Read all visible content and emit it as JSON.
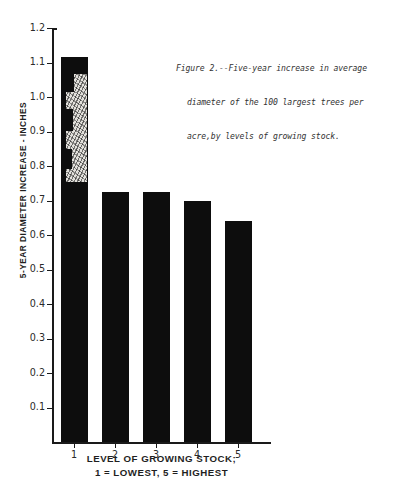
{
  "chart_data": {
    "type": "bar",
    "title": "",
    "caption_lines": [
      "Figure 2.--Five-year increase in average",
      "diameter of the 100 largest trees per",
      "acre,by levels of growing stock."
    ],
    "caption": "Figure 2.--Five-year increase in average diameter of the 100 largest trees per acre,by levels of growing stock.",
    "categories": [
      "1",
      "2",
      "3",
      "4",
      "5"
    ],
    "values": [
      1.115,
      0.725,
      0.725,
      0.7,
      0.64
    ],
    "xlabel_lines": [
      "LEVEL OF GROWING STOCK;",
      "1 = LOWEST,  5 = HIGHEST"
    ],
    "xlabel": "LEVEL OF GROWING STOCK; 1 = LOWEST, 5 = HIGHEST",
    "ylabel": "5-YEAR DIAMETER INCREASE - INCHES",
    "ylim": [
      0.0,
      1.2
    ],
    "yticks": [
      1.2,
      1.1,
      1.0,
      0.9,
      0.8,
      0.7,
      0.6,
      0.5,
      0.4,
      0.3,
      0.2,
      0.1
    ],
    "ytick_labels": [
      "1.2",
      "1.1",
      "1.0",
      "0.9",
      "0.8",
      "0.7",
      "0.6",
      "0.5",
      "0.4",
      "0.3",
      "0.2",
      "0.1"
    ],
    "grid": false,
    "legend": null,
    "bar_color": "#0d0d0d",
    "axis_color": "#1a1a1a",
    "background_color": "#ffffff"
  },
  "annotations": {
    "bar1_defect_note": "light speckled scan damage overlaying bar 1 between ~0.60 and ~1.03 inches"
  }
}
